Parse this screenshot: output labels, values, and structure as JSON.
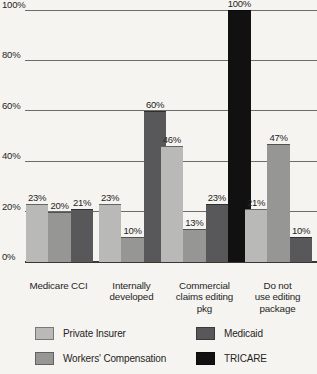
{
  "chart_data": {
    "type": "bar",
    "title": "",
    "xlabel": "",
    "ylabel": "",
    "ylim": [
      0,
      100
    ],
    "yticks": [
      "0%",
      "20%",
      "40%",
      "60%",
      "80%",
      "100%"
    ],
    "grid": true,
    "legend_position": "bottom",
    "categories": [
      "Medicare CCI",
      "Internally developed",
      "Commercial claims editing pkg",
      "Do not use editing package"
    ],
    "category_lines": [
      [
        "Medicare CCI"
      ],
      [
        "Internally",
        "developed"
      ],
      [
        "Commercial",
        "claims editing",
        "pkg"
      ],
      [
        "Do not",
        "use editing",
        "package"
      ]
    ],
    "series": [
      {
        "name": "Private Insurer",
        "color": "#b9b9b7",
        "values": [
          23,
          23,
          46,
          21
        ],
        "labels": [
          "23%",
          "23%",
          "46%",
          "21%"
        ]
      },
      {
        "name": "Workers' Compensation",
        "color": "#969694",
        "values": [
          20,
          10,
          13,
          47
        ],
        "labels": [
          "20%",
          "10%",
          "13%",
          "47%"
        ]
      },
      {
        "name": "Medicaid",
        "color": "#58585a",
        "values": [
          21,
          60,
          23,
          10
        ],
        "labels": [
          "21%",
          "60%",
          "23%",
          "10%"
        ]
      },
      {
        "name": "TRICARE",
        "color": "#111111",
        "values": [
          null,
          null,
          100,
          null
        ],
        "labels": [
          "",
          "",
          "100%",
          ""
        ]
      }
    ]
  },
  "legend": {
    "entries": [
      {
        "label": "Private Insurer",
        "color": "#b9b9b7"
      },
      {
        "label": "Medicaid",
        "color": "#58585a"
      },
      {
        "label": "Workers' Compensation",
        "color": "#969694"
      },
      {
        "label": "TRICARE",
        "color": "#111111"
      }
    ]
  }
}
